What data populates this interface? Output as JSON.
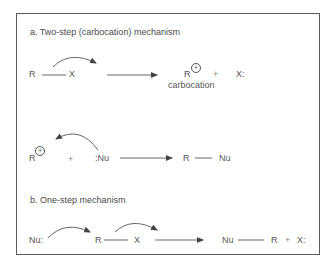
{
  "sections": {
    "a": {
      "title": "a. Two-step (carbocation) mechanism",
      "step1": {
        "reactant_left": "R",
        "reactant_right": "X",
        "product_cation": "R",
        "cation_charge": "+",
        "product_plus": "+",
        "product_leaving_group": "X:",
        "cation_label": "carbocation"
      },
      "step2": {
        "cation": "R",
        "cation_charge": "+",
        "plus": "+",
        "nucleophile": ":Nu",
        "product_left": "R",
        "product_right": "Nu"
      }
    },
    "b": {
      "title": "b. One-step mechanism",
      "nucleophile": "Nu:",
      "substrate_left": "R",
      "substrate_right": "X",
      "product_left": "Nu",
      "product_right": "R",
      "plus": "+",
      "leaving_group": "X:"
    }
  },
  "colors": {
    "ink": "#555555",
    "border": "#5a5a5a",
    "background": "#ffffff"
  }
}
